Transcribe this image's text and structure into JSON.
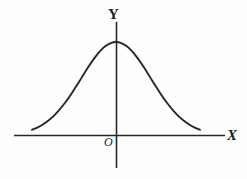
{
  "figure": {
    "title": "",
    "background_color": "#fefefe",
    "line_color": "#262626",
    "labels": {
      "y_axis": "Y",
      "x_axis": "X",
      "origin": "O"
    }
  },
  "chart_data": {
    "type": "line",
    "title": "",
    "subtitle": "",
    "xlabel": "X",
    "ylabel": "Y",
    "grid": false,
    "legend": null,
    "annotations": [
      "O"
    ],
    "axis_style": "cartesian-arrowless",
    "xlim": [
      -3.2,
      3.2
    ],
    "ylim": [
      0,
      1.1
    ],
    "x_axis_pixel_y": 135,
    "y_axis_pixel_x": 116,
    "peak": {
      "x": 0,
      "y": 1.0
    },
    "curve_x_extent": [
      -2.4,
      2.4
    ],
    "series": [
      {
        "name": "normal-curve",
        "x": [
          -2.4,
          -2.25,
          -2.1,
          -1.95,
          -1.8,
          -1.65,
          -1.5,
          -1.35,
          -1.2,
          -1.05,
          -0.9,
          -0.75,
          -0.6,
          -0.45,
          -0.3,
          -0.15,
          0.0,
          0.15,
          0.3,
          0.45,
          0.6,
          0.75,
          0.9,
          1.05,
          1.2,
          1.35,
          1.5,
          1.65,
          1.8,
          1.95,
          2.1,
          2.25,
          2.4
        ],
        "y": [
          0.056,
          0.079,
          0.11,
          0.15,
          0.198,
          0.258,
          0.325,
          0.401,
          0.487,
          0.575,
          0.667,
          0.755,
          0.835,
          0.904,
          0.956,
          0.989,
          1.0,
          0.989,
          0.956,
          0.904,
          0.835,
          0.755,
          0.667,
          0.575,
          0.487,
          0.401,
          0.325,
          0.258,
          0.198,
          0.15,
          0.11,
          0.079,
          0.056
        ]
      }
    ]
  }
}
